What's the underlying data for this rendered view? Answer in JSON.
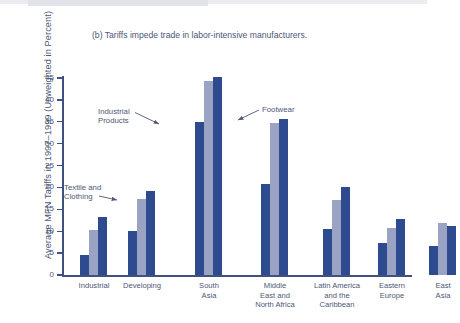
{
  "figure": {
    "title": "(b) Tariffs impede trade in labor-intensive manufacturers.",
    "y_axis_title": "Average MFN Tariffs in 1997–1999 (Unweighted in Percent)"
  },
  "annotations": {
    "industrial_products": "Industrial\nProducts",
    "industrial_products_line1": "Industrial",
    "industrial_products_line2": "Products",
    "textile_clothing_line1": "Textile and",
    "textile_clothing_line2": "Clothing",
    "footwear": "Footwear"
  },
  "colors": {
    "series_industrial_products": "#2e4b8f",
    "series_textile_clothing": "#9aa3c4",
    "series_footwear": "#2e4b8f",
    "axis": "#40507f",
    "text": "#4d5677",
    "background": "#ffffff"
  },
  "chart_data": {
    "type": "bar",
    "title": "(b) Tariffs impede trade in labor-intensive manufacturers.",
    "xlabel": "",
    "ylabel": "Average MFN Tariffs in 1997–1999 (Unweighted in Percent)",
    "ylim": [
      0,
      45
    ],
    "yticks": [
      0,
      5,
      10,
      15,
      20,
      25,
      30,
      35,
      40,
      45
    ],
    "ytick_labels": [
      "0",
      "5",
      "10",
      "15",
      "20",
      "25",
      "30",
      "35",
      "40",
      "45"
    ],
    "grid": false,
    "legend": "annotated-arrows",
    "categories": [
      "Industrial",
      "Developing",
      "South\nAsia",
      "Middle\nEast and\nNorth Africa",
      "Latin America\nand the\nCaribbean",
      "Eastern\nEurope",
      "East\nAsia"
    ],
    "category_lines": [
      [
        "Industrial"
      ],
      [
        "Developing"
      ],
      [
        "South",
        "Asia"
      ],
      [
        "Middle",
        "East and",
        "North Africa"
      ],
      [
        "Latin America",
        "and the",
        "Caribbean"
      ],
      [
        "Eastern",
        "Europe"
      ],
      [
        "East",
        "Asia"
      ]
    ],
    "series": [
      {
        "name": "Industrial Products",
        "color": "#2e4b8f",
        "values": [
          4.5,
          10.1,
          35.0,
          20.8,
          10.4,
          7.2,
          6.7
        ]
      },
      {
        "name": "Textile and Clothing",
        "color": "#9aa3c4",
        "values": [
          10.2,
          17.4,
          44.3,
          34.8,
          17.2,
          10.8,
          11.8
        ]
      },
      {
        "name": "Footwear",
        "color": "#2e4b8f",
        "values": [
          13.3,
          19.2,
          45.2,
          35.7,
          20.2,
          12.8,
          11.1
        ]
      }
    ]
  }
}
